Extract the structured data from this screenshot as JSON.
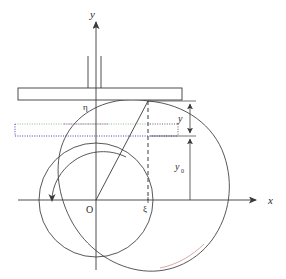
{
  "figure": {
    "background_color": "#ffffff",
    "stroke_color": "#3a3a3a",
    "axes": {
      "y_axis_label": "y",
      "x_axis_label": "x",
      "origin_label": "O"
    },
    "labels": {
      "eta": "η",
      "xi": "ξ",
      "y_dimension": "y",
      "y0_dimension_base": "y",
      "y0_dimension_sub": "0"
    },
    "colors": {
      "line": "#3a3a3a",
      "dotted_green": "#6fbf73",
      "dotted_magenta": "#a33fa3",
      "dotted_blue": "#2b2b9e",
      "curve_red_tint": "#c87f7f",
      "text": "#2b2b2b"
    },
    "geometry": {
      "origin_x": 96,
      "origin_y": 200,
      "y_axis_top": 18,
      "x_axis_right": 262,
      "plate_left": 18,
      "plate_right": 182,
      "plate_top": 88,
      "plate_bottom": 100,
      "inner_circle_cx": 96,
      "inner_circle_cy": 200,
      "inner_circle_r": 57,
      "contact_point_x": 148,
      "contact_point_y": 101,
      "xi_tick_x": 148,
      "dim_line_x": 190
    },
    "elements": [
      {
        "name": "plate",
        "type": "rectangle"
      },
      {
        "name": "plate-stem-left",
        "type": "line"
      },
      {
        "name": "plate-stem-right",
        "type": "line"
      },
      {
        "name": "inner-circle",
        "type": "circle"
      },
      {
        "name": "outer-cardioid-curve",
        "type": "path"
      },
      {
        "name": "rotation-arrow",
        "type": "arc-arrow"
      },
      {
        "name": "radius-line",
        "type": "line"
      },
      {
        "name": "dashed-ordinate",
        "type": "dashed-line"
      },
      {
        "name": "dotted-rectangle",
        "type": "dotted-rectangle"
      },
      {
        "name": "y-dimension-arrow",
        "type": "double-arrow"
      },
      {
        "name": "y0-dimension-arrow",
        "type": "double-arrow"
      }
    ]
  }
}
